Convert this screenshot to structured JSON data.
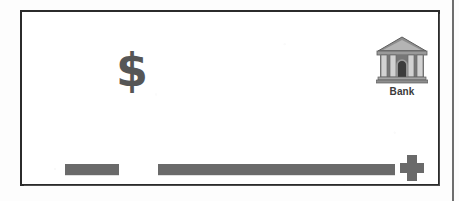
{
  "page": {
    "background_color": "#fdfdfd",
    "margin_rule": {
      "name": "page-margin-rule",
      "color": "#6f6f6f"
    }
  },
  "panel": {
    "border_color": "#2b2b2b",
    "background_color": "#ffffff"
  },
  "symbols": {
    "dollar": {
      "glyph": "$",
      "icon_name": "dollar-sign-icon",
      "color": "#565656"
    },
    "plus": {
      "icon_name": "plus-icon",
      "color": "#6a6a6a"
    }
  },
  "bank": {
    "icon_name": "bank-building-icon",
    "label": "Bank",
    "label_color": "#3a3a3a",
    "body_color": "#8e8e8e",
    "column_color": "#d8d8d8",
    "roof_color": "#7a7a7a",
    "door_color": "#3c3c3c"
  },
  "bars": {
    "color": "#6a6a6a",
    "items": [
      {
        "name": "short-gray-bar",
        "width_px": 54
      },
      {
        "name": "long-gray-bar",
        "width_px": 237
      }
    ]
  }
}
